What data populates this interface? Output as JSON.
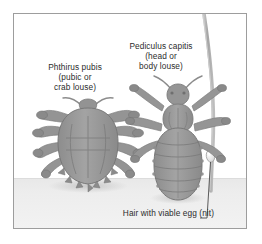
{
  "figure": {
    "background_color": "#ffffff",
    "frame_color": "#9d9d9d",
    "ground_color": "#ececec",
    "specimen_color": "#9a9a9a",
    "hair_color": "#b0b0b0",
    "text_color": "#2c2c2c"
  },
  "labels": {
    "crab_louse": {
      "line1": "Phthirus pubis",
      "line2": "(pubic or",
      "line3": "crab louse)"
    },
    "head_louse": {
      "line1": "Pediculus capitis",
      "line2": "(head or",
      "line3": "body louse)"
    },
    "nit": {
      "line1": "Hair with viable egg (nit)"
    }
  },
  "specimens": [
    {
      "name": "phthirus-pubis",
      "common_name": "pubic or crab louse",
      "scientific_name": "Phthirus pubis"
    },
    {
      "name": "pediculus-capitis",
      "common_name": "head or body louse",
      "scientific_name": "Pediculus capitis"
    }
  ],
  "annotations": [
    {
      "name": "nit-on-hair",
      "text": "Hair with viable egg (nit)",
      "has_leader_line": true
    }
  ]
}
